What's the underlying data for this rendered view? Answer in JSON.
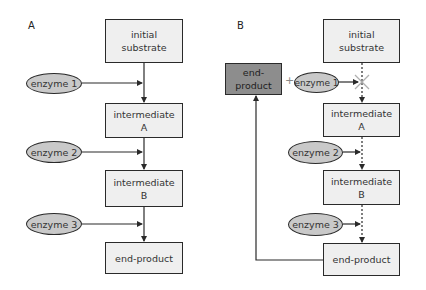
{
  "panels": {
    "A": {
      "label": "A",
      "boxes": {
        "initial_substrate": "initial\nsubstrate",
        "intermediate_a": "intermediate\nA",
        "intermediate_b": "intermediate\nB",
        "end_product": "end-product"
      },
      "enzymes": [
        "enzyme 1",
        "enzyme 2",
        "enzyme 3"
      ]
    },
    "B": {
      "label": "B",
      "boxes": {
        "initial_substrate": "initial\nsubstrate",
        "intermediate_a": "intermediate\nA",
        "intermediate_b": "intermediate\nB",
        "end_product": "end-product",
        "inhibitor": "end-\nproduct"
      },
      "enzymes": [
        "enzyme 1",
        "enzyme 2",
        "enzyme 3"
      ],
      "plus": "+"
    }
  },
  "colors": {
    "box_fill": "#efefef",
    "enzyme_fill": "#c9c9c9",
    "inhibitor_fill": "#8d8d8d",
    "line": "#2a2a2a",
    "block_mark": "#b0b0b0"
  }
}
